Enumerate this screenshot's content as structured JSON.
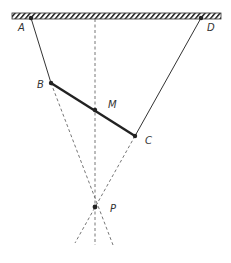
{
  "diagram": {
    "ceiling": {
      "x1": 12,
      "x2": 221,
      "y_top": 13,
      "y_bottom": 19
    },
    "points": {
      "A": {
        "label": "A",
        "x": 31,
        "y": 18,
        "lx": 18,
        "ly": 31
      },
      "D": {
        "label": "D",
        "x": 201,
        "y": 18,
        "lx": 207,
        "ly": 31
      },
      "B": {
        "label": "B",
        "x": 51,
        "y": 83,
        "lx": 37,
        "ly": 88
      },
      "C": {
        "label": "C",
        "x": 135,
        "y": 136,
        "lx": 145,
        "ly": 144
      },
      "M": {
        "label": "M",
        "x": 95,
        "y": 110,
        "lx": 108,
        "ly": 108
      },
      "P": {
        "label": "P",
        "x": 95,
        "y": 207,
        "lx": 110,
        "ly": 212
      }
    },
    "colors": {
      "line": "#333333",
      "rod": "#222222",
      "dash": "#666666"
    }
  }
}
